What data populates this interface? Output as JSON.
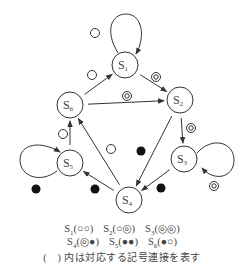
{
  "diagram": {
    "title": "",
    "nodes": [
      {
        "id": "S1",
        "label": "S",
        "sub": "1"
      },
      {
        "id": "S2",
        "label": "S",
        "sub": "2"
      },
      {
        "id": "S3",
        "label": "S",
        "sub": "3"
      },
      {
        "id": "S4",
        "label": "S",
        "sub": "4"
      },
      {
        "id": "S5",
        "label": "S",
        "sub": "5"
      },
      {
        "id": "S6",
        "label": "S",
        "sub": "6"
      }
    ],
    "edges": [
      {
        "from": "S1",
        "to": "S1",
        "symbol": "○"
      },
      {
        "from": "S6",
        "to": "S1",
        "symbol": "○"
      },
      {
        "from": "S1",
        "to": "S2",
        "symbol": "◎"
      },
      {
        "from": "S6",
        "to": "S2",
        "symbol": "◎"
      },
      {
        "from": "S2",
        "to": "S3",
        "symbol": "◎"
      },
      {
        "from": "S3",
        "to": "S3",
        "symbol": "◎"
      },
      {
        "from": "S2",
        "to": "S4",
        "symbol": "●"
      },
      {
        "from": "S3",
        "to": "S4",
        "symbol": "●"
      },
      {
        "from": "S4",
        "to": "S5",
        "symbol": "●"
      },
      {
        "from": "S4",
        "to": "S6",
        "symbol": "○"
      },
      {
        "from": "S5",
        "to": "S6",
        "symbol": "○"
      },
      {
        "from": "S5",
        "to": "S5",
        "symbol": "●"
      }
    ]
  },
  "legend": {
    "rows": [
      [
        {
          "state": "S",
          "sub": "1",
          "pair": "(○○)"
        },
        {
          "state": "S",
          "sub": "2",
          "pair": "(○◎)"
        },
        {
          "state": "S",
          "sub": "3",
          "pair": "(◎◎)"
        }
      ],
      [
        {
          "state": "S",
          "sub": "4",
          "pair": "(◎●)"
        },
        {
          "state": "S",
          "sub": "5",
          "pair": "(●●)"
        },
        {
          "state": "S",
          "sub": "6",
          "pair": "(●○)"
        }
      ]
    ],
    "caption": "(　) 内は対応する記号連接を表す"
  }
}
